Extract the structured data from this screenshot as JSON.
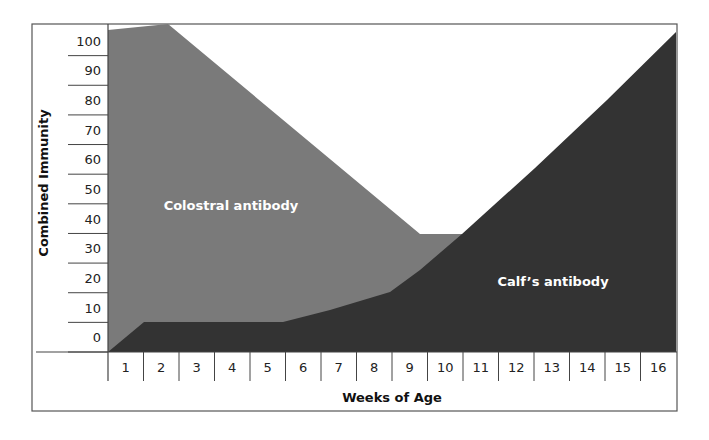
{
  "chart_data": {
    "type": "area",
    "title": "",
    "xlabel": "Weeks of Age",
    "ylabel": "Combined Immunity",
    "x_ticks": [
      "1",
      "2",
      "3",
      "4",
      "5",
      "6",
      "7",
      "8",
      "9",
      "10",
      "11",
      "12",
      "13",
      "14",
      "15",
      "16"
    ],
    "y_ticks": [
      "0",
      "10",
      "20",
      "30",
      "40",
      "50",
      "60",
      "70",
      "80",
      "90",
      "100"
    ],
    "ylim": [
      0,
      110
    ],
    "grid": false,
    "legend": "none (inline area labels)",
    "series": [
      {
        "name": "Colostral antibody",
        "color": "#7a7a7a",
        "x": [
          0,
          1.7,
          9,
          10.2,
          11
        ],
        "combined_values": [
          101,
          110,
          38,
          38,
          38
        ],
        "label": "Colostral antibody"
      },
      {
        "name": "Calf's antibody",
        "color": "#333333",
        "x": [
          0,
          1,
          5,
          8,
          10,
          12,
          16
        ],
        "values": [
          0,
          10,
          10,
          20,
          38,
          60,
          108
        ],
        "label": "Calf’s antibody"
      }
    ]
  },
  "labels": {
    "colostral": "Colostral antibody",
    "calf": "Calf’s antibody",
    "xlabel": "Weeks of Age",
    "ylabel": "Combined Immunity"
  },
  "geometry": {
    "colostral_points": "108,352 108,30 168,24 420,234 462,234 462,352",
    "calf_points": "108,352 144,322 283,322 330,310 390,292 420,270 462,234 535,168 607,100 676,32 676,352"
  }
}
